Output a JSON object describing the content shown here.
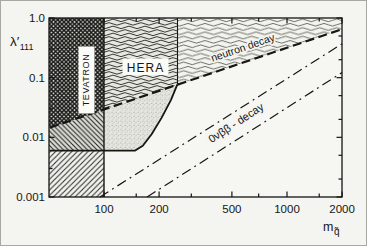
{
  "figure": {
    "type": "physics exclusion plot",
    "labels": {
      "y_axis_main": "λ′",
      "y_axis_sub": "111",
      "x_axis_main": "m",
      "x_axis_sub": "q̃",
      "tevatron": "TEVATRON",
      "hera": "HERA",
      "neutron": "neutron decay",
      "onbb": "0νββ - decay"
    }
  },
  "chart_data": {
    "type": "line",
    "title": "",
    "xlabel": "m_q̃",
    "ylabel": "λ′111",
    "x_scale": "log",
    "y_scale": "log",
    "x_range": [
      50,
      2000
    ],
    "y_range": [
      0.001,
      1.0
    ],
    "grid": false,
    "x_axis": {
      "major": [
        100,
        200,
        500,
        1000,
        2000
      ],
      "major_labels": [
        "100",
        "200",
        "500",
        "1000",
        "2000"
      ],
      "minor": [
        150,
        300,
        700,
        1500
      ]
    },
    "y_axis": {
      "major": [
        1.0,
        0.1,
        0.01,
        0.001
      ],
      "major_labels": [
        "1.0",
        "0.1",
        "0.01",
        "0.001"
      ],
      "minor_left": [
        0.3,
        0.03,
        0.003
      ],
      "minor_right": [
        0.5,
        0.2,
        0.05,
        0.02,
        0.005,
        0.002
      ]
    },
    "series": [
      {
        "name": "neutron-decay-bound",
        "style": "dashed",
        "width": 2.2,
        "points": [
          [
            50.5,
            0.0145
          ],
          [
            2000,
            0.65
          ]
        ]
      },
      {
        "name": "onbb-bound-upper",
        "style": "dashdot",
        "width": 1.2,
        "points": [
          [
            95,
            0.001
          ],
          [
            2000,
            0.37
          ]
        ]
      },
      {
        "name": "onbb-bound-lower",
        "style": "dashdot",
        "width": 1.2,
        "points": [
          [
            172,
            0.001
          ],
          [
            2000,
            0.122
          ]
        ]
      },
      {
        "name": "solid-lower-bound",
        "style": "solid",
        "width": 1.8,
        "points": [
          [
            50.5,
            0.006
          ],
          [
            148,
            0.006
          ],
          [
            163,
            0.0072
          ],
          [
            182,
            0.0113
          ],
          [
            206,
            0.021
          ],
          [
            232,
            0.042
          ],
          [
            252,
            0.078
          ]
        ]
      },
      {
        "name": "tevatron-right-edge",
        "style": "solid",
        "width": 1.4,
        "points": [
          [
            100,
            1.0
          ],
          [
            100,
            0.001
          ]
        ]
      },
      {
        "name": "hera-right-edge",
        "style": "solid",
        "width": 1.1,
        "points": [
          [
            252,
            1.0
          ],
          [
            252,
            0.078
          ]
        ]
      }
    ],
    "regions": [
      {
        "name": "TEVATRON",
        "pattern": "dark-crosshatch",
        "bounds": "m ≲ 100, above neutron-decay dashed line"
      },
      {
        "name": "HERA",
        "pattern": "dense-wavy",
        "bounds": "100 ≲ m ≲ 250, above neutron-decay dashed line"
      },
      {
        "name": "neutron decay",
        "pattern": "light-wavy",
        "bounds": "above dashed line, m ≳ 250"
      },
      {
        "name": "HERA reach",
        "pattern": "stipple",
        "bounds": "between dashed line and solid curve, 100 ≲ m ≲ 250"
      },
      {
        "name": "hatched strip",
        "pattern": "backslash-hatch",
        "bounds": "m ≲ 100, between dashed line and λ ≈ 0.006"
      },
      {
        "name": "hatched block",
        "pattern": "slash-hatch",
        "bounds": "m ≲ 100, λ ≈ 0.001–0.006"
      }
    ]
  }
}
